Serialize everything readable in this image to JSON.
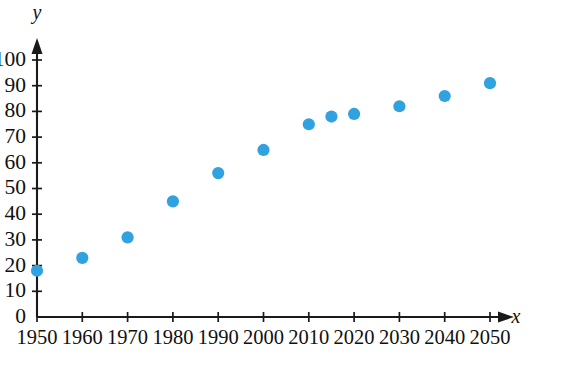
{
  "chart_data": {
    "type": "scatter",
    "title": "",
    "subtitle": "",
    "xlabel": "x",
    "ylabel": "y",
    "xlim": [
      1950,
      2050
    ],
    "ylim": [
      0,
      100
    ],
    "x_ticks": [
      1950,
      1960,
      1970,
      1980,
      1990,
      2000,
      2010,
      2020,
      2030,
      2040,
      2050
    ],
    "x_tick_labels": [
      "1950",
      "1960",
      "1970",
      "1980",
      "1990",
      "2000",
      "2010",
      "2020",
      "2030",
      "2040",
      "2050"
    ],
    "y_ticks": [
      0,
      10,
      20,
      30,
      40,
      50,
      60,
      70,
      80,
      90,
      100
    ],
    "y_tick_labels": [
      "0",
      "10",
      "20",
      "30",
      "40",
      "50",
      "60",
      "70",
      "80",
      "90",
      "100"
    ],
    "grid": false,
    "legend": false,
    "legend_position": "none",
    "marker_color": "#31a2e0",
    "marker_shape": "circle",
    "axis_color": "#1a1a1a",
    "series": [
      {
        "name": "",
        "points": [
          {
            "x": 1950,
            "y": 18
          },
          {
            "x": 1960,
            "y": 23
          },
          {
            "x": 1970,
            "y": 31
          },
          {
            "x": 1980,
            "y": 45
          },
          {
            "x": 1990,
            "y": 56
          },
          {
            "x": 2000,
            "y": 65
          },
          {
            "x": 2010,
            "y": 75
          },
          {
            "x": 2015,
            "y": 78
          },
          {
            "x": 2020,
            "y": 79
          },
          {
            "x": 2030,
            "y": 82
          },
          {
            "x": 2040,
            "y": 86
          },
          {
            "x": 2050,
            "y": 91
          }
        ]
      }
    ]
  }
}
